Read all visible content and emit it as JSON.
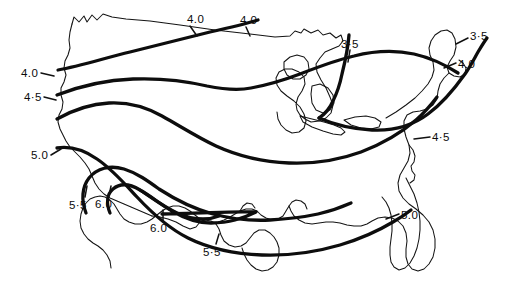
{
  "figure": {
    "type": "contour-map",
    "region": "continental-united-states",
    "background_color": "#ffffff",
    "ink_color": "#0d0d0d",
    "coastline_color": "#141414"
  },
  "chart_data": {
    "type": "contour",
    "title": "",
    "subtitle": "",
    "xlabel": "",
    "ylabel": "",
    "grid": false,
    "legend": "none",
    "contour_levels": [
      3.5,
      4.0,
      4.5,
      5.0,
      5.5,
      6.0
    ],
    "level_labels": [
      "3·5",
      "4.0",
      "4·5",
      "5.0",
      "5·5",
      "6.0"
    ],
    "value_range": [
      3.5,
      6.0
    ],
    "gradient_note": "values increase from northeast (3.5) toward southwest (6.0)",
    "labels": [
      {
        "id": "label-4p0-north-central",
        "text": "4.0",
        "x": 187,
        "y": 14,
        "leader": true
      },
      {
        "id": "label-4p0-north-east",
        "text": "4.0",
        "x": 240,
        "y": 15,
        "leader": true
      },
      {
        "id": "label-3p5-great-lakes",
        "text": "3·5",
        "x": 341,
        "y": 39,
        "leader": true
      },
      {
        "id": "label-3p5-northeast",
        "text": "3·5",
        "x": 470,
        "y": 31,
        "leader": true
      },
      {
        "id": "label-4p0-northeast",
        "text": "4.0",
        "x": 458,
        "y": 59,
        "leader": true
      },
      {
        "id": "label-4p0-west-coast",
        "text": "4.0",
        "x": 21,
        "y": 68,
        "leader": true
      },
      {
        "id": "label-4p5-west-coast",
        "text": "4·5",
        "x": 24,
        "y": 92,
        "leader": true
      },
      {
        "id": "label-4p5-mid-atlantic",
        "text": "4·5",
        "x": 432,
        "y": 132,
        "leader": true
      },
      {
        "id": "label-5p0-california",
        "text": "5.0",
        "x": 31,
        "y": 150,
        "leader": true
      },
      {
        "id": "label-5p5-southwest",
        "text": "5·5",
        "x": 69,
        "y": 200,
        "leader": true
      },
      {
        "id": "label-6p0-southwest",
        "text": "6.0",
        "x": 95,
        "y": 199,
        "leader": true
      },
      {
        "id": "label-6p0-texas",
        "text": "6.0",
        "x": 150,
        "y": 223,
        "leader": true
      },
      {
        "id": "label-5p5-texas",
        "text": "5·5",
        "x": 203,
        "y": 247,
        "leader": true
      },
      {
        "id": "label-5p0-southeast",
        "text": "5.0",
        "x": 401,
        "y": 210,
        "leader": true
      }
    ]
  }
}
